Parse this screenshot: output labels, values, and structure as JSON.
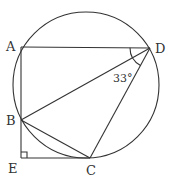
{
  "figure": {
    "type": "geometry",
    "points": {
      "A": {
        "label": "A",
        "x": 21,
        "y": 47
      },
      "B": {
        "label": "B",
        "x": 21,
        "y": 120
      },
      "C": {
        "label": "C",
        "x": 90,
        "y": 158
      },
      "D": {
        "label": "D",
        "x": 150,
        "y": 48
      },
      "E": {
        "label": "E",
        "x": 21,
        "y": 158
      }
    },
    "circle": {
      "cx": 86,
      "cy": 85,
      "r": 73
    },
    "segments": [
      "AD",
      "AB",
      "BE",
      "EC",
      "BD",
      "BC",
      "CD"
    ],
    "right_angle_at": "E",
    "angle_annotation": {
      "vertex": "D",
      "between": [
        "DA",
        "DC"
      ],
      "label": "33°"
    },
    "colors": {
      "stroke": "#333333",
      "background": "#ffffff"
    }
  }
}
